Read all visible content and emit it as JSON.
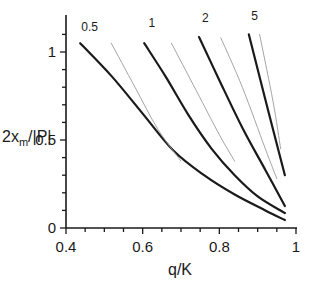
{
  "chart_data": {
    "type": "line",
    "title": "",
    "xlabel": "q/K",
    "ylabel": "2x_m/|P|",
    "xlim": [
      0.4,
      1.0
    ],
    "ylim": [
      0,
      1.15
    ],
    "grid": false,
    "legend": "inline curve labels at top",
    "x_ticks": [
      {
        "value": 0.4,
        "label": "0.4"
      },
      {
        "value": 0.6,
        "label": "0.6"
      },
      {
        "value": 0.8,
        "label": "0.8"
      },
      {
        "value": 1.0,
        "label": "1"
      }
    ],
    "y_ticks": [
      {
        "value": 0,
        "label": "0"
      },
      {
        "value": 0.5,
        "label": "0.5"
      },
      {
        "value": 1.0,
        "label": "1"
      }
    ],
    "series": [
      {
        "name": "0.5",
        "style": "thick-black",
        "x": [
          0.437,
          0.52,
          0.6,
          0.68,
          0.76,
          0.84,
          0.92,
          0.971
        ],
        "y": [
          1.05,
          0.86,
          0.65,
          0.44,
          0.3,
          0.19,
          0.1,
          0.045
        ]
      },
      {
        "name": "0.5 (asymptote)",
        "style": "thin-gray",
        "x": [
          0.518,
          0.58,
          0.64,
          0.7
        ],
        "y": [
          1.05,
          0.8,
          0.56,
          0.38
        ]
      },
      {
        "name": "1",
        "style": "thick-black",
        "x": [
          0.604,
          0.66,
          0.72,
          0.78,
          0.84,
          0.9,
          0.971
        ],
        "y": [
          1.05,
          0.86,
          0.64,
          0.45,
          0.3,
          0.18,
          0.085
        ]
      },
      {
        "name": "1 (asymptote)",
        "style": "thin-gray",
        "x": [
          0.675,
          0.74,
          0.8,
          0.84
        ],
        "y": [
          1.05,
          0.78,
          0.53,
          0.38
        ]
      },
      {
        "name": "2",
        "style": "thick-black",
        "x": [
          0.747,
          0.8,
          0.86,
          0.92,
          0.971
        ],
        "y": [
          1.085,
          0.84,
          0.57,
          0.33,
          0.125
        ]
      },
      {
        "name": "2 (asymptote)",
        "style": "thin-gray",
        "x": [
          0.804,
          0.86,
          0.92,
          0.95
        ],
        "y": [
          1.08,
          0.8,
          0.45,
          0.28
        ]
      },
      {
        "name": "5",
        "style": "thick-black",
        "x": [
          0.877,
          0.92,
          0.971
        ],
        "y": [
          1.1,
          0.73,
          0.3
        ]
      },
      {
        "name": "5 (asymptote)",
        "style": "thin-gray",
        "x": [
          0.905,
          0.94,
          0.96
        ],
        "y": [
          1.1,
          0.72,
          0.45
        ]
      }
    ],
    "curve_labels": [
      {
        "text": "0.5",
        "x": 0.44,
        "y": 1.12
      },
      {
        "text": "1",
        "x": 0.615,
        "y": 1.14
      },
      {
        "text": "2",
        "x": 0.755,
        "y": 1.17
      },
      {
        "text": "5",
        "x": 0.883,
        "y": 1.18
      }
    ]
  },
  "colors": {
    "thick": "#1a1a1a",
    "thin": "#9a9a9a",
    "axis": "#1a1a1a"
  },
  "labels": {
    "x_axis": "q/K",
    "y_axis_main": "2x",
    "y_axis_sub": "m",
    "y_axis_tail": "/|P|"
  }
}
